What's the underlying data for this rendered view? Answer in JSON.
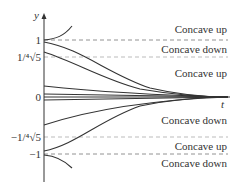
{
  "axes": {
    "y_label": "y",
    "x_label": "t"
  },
  "y_ticks": [
    {
      "label": "1",
      "value": 1
    },
    {
      "label": "1/⁴√5",
      "value": 0.6687
    },
    {
      "label": "0",
      "value": 0
    },
    {
      "label": "−1/⁴√5",
      "value": -0.6687
    },
    {
      "label": "−1",
      "value": -1
    }
  ],
  "regions": [
    {
      "label": "Concave up"
    },
    {
      "label": "Concave down"
    },
    {
      "label": "Concave up"
    },
    {
      "label": "Concave down"
    },
    {
      "label": "Concave up"
    },
    {
      "label": "Concave down"
    }
  ],
  "colors": {
    "curve": "#333333",
    "dashed": "#999999",
    "text": "#333333"
  }
}
